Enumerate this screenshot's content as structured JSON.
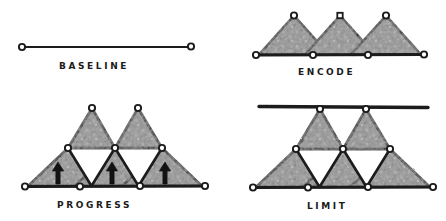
{
  "figure": {
    "title": "",
    "background_color": "#ffffff",
    "ink_color": "#1b1b1b",
    "fill_color": "#8a8a8a",
    "empty_color": "#ffffff",
    "style": "hand-drawn pencil sketch"
  },
  "panels": [
    {
      "id": "baseline",
      "label": "BASELINE",
      "node_count": 2,
      "triangle_count": 0,
      "arrow_count": 0,
      "has_limit_bar": false,
      "description": "single horizontal line with open circle node at each end"
    },
    {
      "id": "encode",
      "label": "ENCODE",
      "node_count": 7,
      "triangle_count": 3,
      "arrow_count": 0,
      "has_limit_bar": false,
      "description": "three shaded upward triangles standing on a baseline"
    },
    {
      "id": "progress",
      "label": "PROGRESS",
      "node_count": 9,
      "triangle_count": 5,
      "empty_triangle_count": 2,
      "arrow_count": 3,
      "has_limit_bar": false,
      "description": "two tiers of shaded triangles with upward arrows in the bottom row"
    },
    {
      "id": "limit",
      "label": "LIMIT",
      "node_count": 9,
      "triangle_count": 5,
      "empty_triangle_count": 2,
      "arrow_count": 0,
      "has_limit_bar": true,
      "description": "two tiers of shaded triangles capped by a horizontal limit bar"
    }
  ],
  "legend": {
    "node_name": "vertex-node",
    "fill_name": "shaded-triangle",
    "empty_name": "open-triangle",
    "arrow_name": "up-arrow",
    "bar_name": "limit-bar"
  }
}
